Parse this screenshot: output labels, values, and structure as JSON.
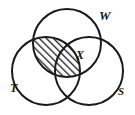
{
  "figure": {
    "type": "venn-diagram",
    "sets": [
      {
        "id": "W",
        "label": "W",
        "position": "top",
        "label_x": 99,
        "label_y": 20
      },
      {
        "id": "T",
        "label": "T",
        "position": "bottom-left",
        "label_x": 10,
        "label_y": 92
      },
      {
        "id": "S",
        "label": "S",
        "position": "bottom-right",
        "label_x": 118,
        "label_y": 95
      }
    ],
    "region_labels": [
      {
        "id": "X",
        "label": "X",
        "region": "W-intersect-S",
        "label_x": 76,
        "label_y": 59
      }
    ],
    "shaded_region": {
      "region": "W-intersect-T",
      "fill": "diagonal-hatch",
      "hatch_angle_deg": 45
    },
    "colors": {
      "stroke": "#1a1a1a",
      "background": "#ffffff",
      "hatch": "#1a1a1a"
    },
    "geometry": {
      "circle_radius": 34,
      "circle_w": {
        "cx": 67,
        "cy": 43
      },
      "circle_t": {
        "cx": 46,
        "cy": 71
      },
      "circle_s": {
        "cx": 89,
        "cy": 71
      },
      "stroke_width": 2
    }
  }
}
